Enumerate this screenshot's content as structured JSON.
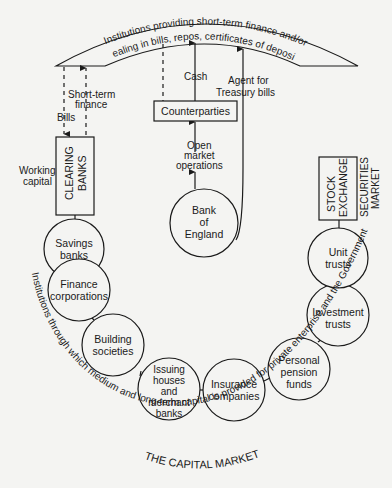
{
  "diagram": {
    "title": "THE CAPITAL MARKET",
    "top_arc": {
      "line1": "Institutions providing short-term finance and/or",
      "line2": "dealing in bills, repos, certificates of deposit"
    },
    "bottom_arc_text": "Institutions through which medium and long-term capital is provided for private enterprise and the Government",
    "boxes": {
      "clearing_banks": "CLEARING BANKS",
      "clearing_line1": "CLEARING",
      "clearing_line2": "BANKS",
      "counterparties": "Counterparties",
      "stock_line1": "STOCK",
      "stock_line2": "EXCHANGE"
    },
    "side_labels": {
      "working_capital_1": "Working",
      "working_capital_2": "capital",
      "securities_1": "SECURITIES",
      "securities_2": "MARKET"
    },
    "flow_labels": {
      "bills": "Bills",
      "short_term_1": "Short-term",
      "short_term_2": "finance",
      "cash": "Cash",
      "agent_1": "Agent for",
      "agent_2": "Treasury bills",
      "omo_1": "Open",
      "omo_2": "market",
      "omo_3": "operations"
    },
    "nodes": [
      {
        "id": "savings-banks",
        "lines": [
          "Savings",
          "banks"
        ]
      },
      {
        "id": "finance-corporations",
        "lines": [
          "Finance",
          "corporations"
        ]
      },
      {
        "id": "building-societies",
        "lines": [
          "Building",
          "societies"
        ]
      },
      {
        "id": "issuing-houses",
        "lines": [
          "Issuing",
          "houses",
          "and",
          "merchant",
          "banks"
        ]
      },
      {
        "id": "insurance-companies",
        "lines": [
          "Insurance",
          "companies"
        ]
      },
      {
        "id": "personal-pension-funds",
        "lines": [
          "Personal",
          "pension",
          "funds"
        ]
      },
      {
        "id": "investment-trusts",
        "lines": [
          "Investment",
          "trusts"
        ]
      },
      {
        "id": "unit-trusts",
        "lines": [
          "Unit",
          "trusts"
        ]
      },
      {
        "id": "bank-of-england",
        "lines": [
          "Bank",
          "of",
          "England"
        ]
      }
    ]
  }
}
